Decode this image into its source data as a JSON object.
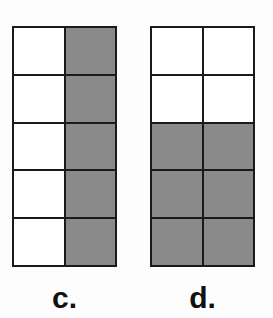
{
  "figures": [
    {
      "label": "c.",
      "rows": 5,
      "cols": 2,
      "shaded": [
        [
          false,
          true
        ],
        [
          false,
          true
        ],
        [
          false,
          true
        ],
        [
          false,
          true
        ],
        [
          false,
          true
        ]
      ]
    },
    {
      "label": "d.",
      "rows": 5,
      "cols": 2,
      "shaded": [
        [
          false,
          false
        ],
        [
          false,
          false
        ],
        [
          true,
          true
        ],
        [
          true,
          true
        ],
        [
          true,
          true
        ]
      ]
    }
  ],
  "colors": {
    "shade": "#8a8a8a",
    "line": "#1a1a1a",
    "empty": "#ffffff"
  }
}
